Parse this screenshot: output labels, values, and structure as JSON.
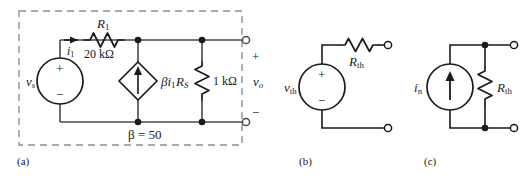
{
  "figure": {
    "background_color": "#ffffff",
    "line_color": "#1a1a1a",
    "wire_color": "#3a3a3a",
    "dashed_color": "#8a8a8a"
  },
  "panels": [
    {
      "id": "a",
      "caption": "(a)",
      "title": "dependent-source amplifier circuit",
      "enclosure": "dashed-box",
      "components": {
        "source_label": "v",
        "source_sub": "s",
        "source_plus": "+",
        "source_minus": "−",
        "current_label": "i",
        "current_sub": "1",
        "resistor1_label": "R",
        "resistor1_sub": "1",
        "resistor1_value": "20 kΩ",
        "dependent_source_label": "βi",
        "dependent_source_sub": "1",
        "resistor_s_label": "R",
        "resistor_s_sub": "S",
        "resistor_s_value": "1 kΩ",
        "beta_note": "β = 50",
        "output_label": "v",
        "output_sub": "o",
        "terminal_plus": "+",
        "terminal_minus": "−"
      }
    },
    {
      "id": "b",
      "caption": "(b)",
      "title": "Thevenin equivalent",
      "components": {
        "source_label": "v",
        "source_sub": "th",
        "source_plus": "+",
        "source_minus": "−",
        "resistor_label": "R",
        "resistor_sub": "th"
      }
    },
    {
      "id": "c",
      "caption": "(c)",
      "title": "Norton equivalent",
      "components": {
        "source_label": "i",
        "source_sub": "n",
        "resistor_label": "R",
        "resistor_sub": "th"
      }
    }
  ]
}
